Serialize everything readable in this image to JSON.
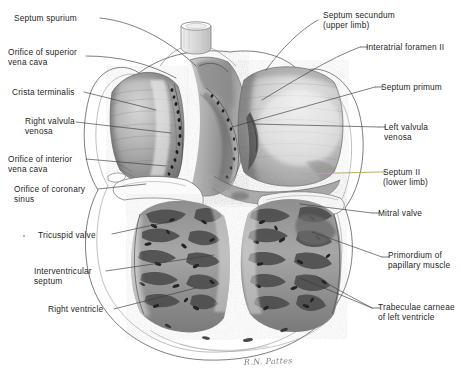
{
  "figure": {
    "signature": "R.N. Pattes",
    "background_color": "#ffffff",
    "ink_color": "#262626",
    "accent_leader_color": "#b6b061"
  },
  "labels": {
    "left": [
      {
        "id": "septum-spurium",
        "text": "Septum spurium",
        "x": 14,
        "y": 14
      },
      {
        "id": "orifice-superior-vena-cava",
        "text": "Orifice of superior\nvena cava",
        "x": 8,
        "y": 48
      },
      {
        "id": "crista-terminalis",
        "text": "Crista terminalis",
        "x": 12,
        "y": 88
      },
      {
        "id": "right-valvula-venosa",
        "text": "Right valvula\nvenosa",
        "x": 25,
        "y": 117
      },
      {
        "id": "orifice-interior-vena-cava",
        "text": "Orifice of interior\nvena cava",
        "x": 8,
        "y": 155
      },
      {
        "id": "orifice-coronary-sinus",
        "text": "Orifice of coronary\nsinus",
        "x": 14,
        "y": 185
      },
      {
        "id": "tricuspid-valve",
        "text": "Tricuspid valve",
        "x": 38,
        "y": 231
      },
      {
        "id": "interventricular-septum",
        "text": "Interventricular\nseptum",
        "x": 34,
        "y": 267
      },
      {
        "id": "right-ventricle",
        "text": "Right ventricle",
        "x": 48,
        "y": 305
      }
    ],
    "right": [
      {
        "id": "septum-secundum",
        "text": "Septum secundum\n(upper limb)",
        "x": 323,
        "y": 11
      },
      {
        "id": "interatrial-foramen-ii",
        "text": "Interatrial foramen II",
        "x": 366,
        "y": 43
      },
      {
        "id": "septum-primum",
        "text": "Septum primum",
        "x": 381,
        "y": 83
      },
      {
        "id": "left-valvula-venosa",
        "text": "Left valvula\nvenosa",
        "x": 384,
        "y": 123
      },
      {
        "id": "septum-ii-lower-limb",
        "text": "Septum II\n(lower limb)",
        "x": 383,
        "y": 168,
        "accent": true
      },
      {
        "id": "mitral-valve",
        "text": "Mitral valve",
        "x": 378,
        "y": 209
      },
      {
        "id": "primordium-papillary-muscle",
        "text": "Primordium of\npapillary muscle",
        "x": 388,
        "y": 251
      },
      {
        "id": "trabeculae-carneae",
        "text": "Trabeculae carneae\nof left ventricle",
        "x": 378,
        "y": 303
      }
    ]
  },
  "leaders": {
    "description": "Thin straight pointer lines from each label to its anatomical structure",
    "count": 17
  }
}
